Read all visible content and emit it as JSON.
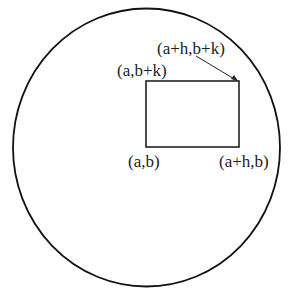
{
  "diagram": {
    "labels": {
      "top_right": "(a+h,b+k)",
      "top_left": "(a,b+k)",
      "bottom_left": "(a,b)",
      "bottom_right": "(a+h,b)"
    },
    "colors": {
      "stroke": "#111111",
      "text": "#222222",
      "background": "#ffffff"
    }
  }
}
